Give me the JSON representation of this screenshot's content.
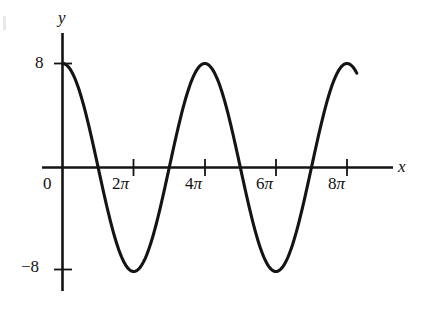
{
  "figure": {
    "background_color": "#ffffff",
    "curve_color": "#141414",
    "axis_color": "#141414"
  },
  "axes": {
    "y_axis_label": "y",
    "x_axis_label": "x",
    "origin_label": "0"
  },
  "y_ticks": [
    {
      "value": 8,
      "label": "8"
    },
    {
      "value": -8,
      "label": "−8"
    }
  ],
  "x_ticks": [
    {
      "value": 0,
      "coefficient": "",
      "symbol": ""
    },
    {
      "value": 6.283185307,
      "coefficient": "2",
      "symbol": "π"
    },
    {
      "value": 12.56637061,
      "coefficient": "4",
      "symbol": "π"
    },
    {
      "value": 18.84955592,
      "coefficient": "6",
      "symbol": "π"
    },
    {
      "value": 25.13274123,
      "coefficient": "8",
      "symbol": "π"
    }
  ],
  "chart_data": {
    "type": "line",
    "title": "",
    "xlabel": "x",
    "ylabel": "y",
    "grid": false,
    "legend": "none",
    "xlim": [
      -2.2,
      28.5
    ],
    "ylim": [
      -10.5,
      11.0
    ],
    "xticks": [
      0,
      6.283185307,
      12.56637061,
      18.84955592,
      25.13274123
    ],
    "xticklabels": [
      "0",
      "2π",
      "4π",
      "6π",
      "8π"
    ],
    "yticks": [
      -8,
      8
    ],
    "yticklabels": [
      "−8",
      "8"
    ],
    "series": [
      {
        "name": "y = 8 cos(x/2)",
        "equation": "y = 8*cos(x/2)",
        "amplitude": 8,
        "period": 12.56637061,
        "x_start": 0,
        "x_end": 26.0,
        "x": [
          0,
          1.2566,
          2.5133,
          3.7699,
          5.0265,
          6.2832,
          7.5398,
          8.7965,
          10.0531,
          11.3097,
          12.5664,
          13.823,
          15.0796,
          16.3363,
          17.5929,
          18.8496,
          20.1062,
          21.3628,
          22.6195,
          23.8761,
          25.1327,
          26.0
        ],
        "y": [
          8.0,
          7.61,
          6.47,
          4.7,
          2.47,
          0.0,
          -2.47,
          -4.7,
          -6.47,
          -7.61,
          -8.0,
          -7.61,
          -6.47,
          -4.7,
          -2.47,
          0.0,
          2.47,
          4.7,
          6.47,
          7.61,
          8.0,
          7.85
        ]
      }
    ],
    "annotations": {
      "maxima": [
        {
          "x": "0",
          "y": 8
        },
        {
          "x": "8π",
          "y": 8
        }
      ],
      "minima": [
        {
          "x": "4π",
          "y": -8
        }
      ],
      "zeros": [
        "2π",
        "6π"
      ]
    }
  }
}
